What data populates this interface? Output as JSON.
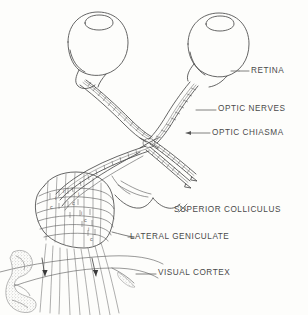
{
  "figure": {
    "background_color": "#fdfdfb",
    "ink_color": "#4a4a4a",
    "style": "scanned line art, black and white"
  },
  "labels": [
    {
      "id": "retina",
      "text": "RETINA",
      "x": 251,
      "y": 74,
      "leader": true
    },
    {
      "id": "optic-nerves",
      "text": "OPTIC NERVES",
      "x": 218,
      "y": 112,
      "leader": true
    },
    {
      "id": "optic-chiasma",
      "text": "OPTIC CHIASMA",
      "x": 212,
      "y": 136,
      "leader": true
    },
    {
      "id": "superior-colliculus",
      "text": "SUPERIOR COLLICULUS",
      "x": 174,
      "y": 210,
      "leader": true
    },
    {
      "id": "lateral-geniculate",
      "text": "LATERAL GENICULATE",
      "x": 130,
      "y": 239,
      "leader": true
    },
    {
      "id": "visual-cortex",
      "text": "VISUAL CORTEX",
      "x": 158,
      "y": 276,
      "leader": true
    }
  ],
  "structures": [
    {
      "id": "left-eye",
      "name": "left eyeball with cornea"
    },
    {
      "id": "right-eye",
      "name": "right eyeball with cornea"
    },
    {
      "id": "optic-nerve-left",
      "name": "left optic nerve"
    },
    {
      "id": "optic-nerve-right",
      "name": "right optic nerve"
    },
    {
      "id": "optic-chiasma",
      "name": "optic chiasma crossing"
    },
    {
      "id": "optic-tract-left",
      "name": "left optic tract"
    },
    {
      "id": "optic-tract-right",
      "name": "right optic tract"
    },
    {
      "id": "lateral-geniculate-body",
      "name": "lateral geniculate nucleus with laminae"
    },
    {
      "id": "superior-colliculus-body",
      "name": "superior colliculus"
    },
    {
      "id": "optic-radiation",
      "name": "optic radiation fibers"
    },
    {
      "id": "visual-cortex-body",
      "name": "visual cortex (stippled cortical fold)"
    }
  ],
  "geniculate_layers": [
    {
      "label": "i",
      "x": 78,
      "y": 196
    },
    {
      "label": "c",
      "x": 72,
      "y": 205
    },
    {
      "label": "i",
      "x": 81,
      "y": 215
    },
    {
      "label": "c",
      "x": 84,
      "y": 219
    },
    {
      "label": "i",
      "x": 88,
      "y": 228
    },
    {
      "label": "c",
      "x": 90,
      "y": 238
    },
    {
      "label": "i",
      "x": 57,
      "y": 200
    },
    {
      "label": "c",
      "x": 52,
      "y": 210
    },
    {
      "label": "i",
      "x": 63,
      "y": 193
    }
  ]
}
